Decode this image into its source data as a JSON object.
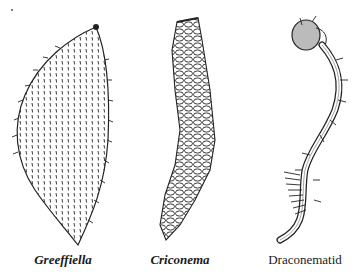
{
  "figure": {
    "specimens": [
      {
        "name": "Greeffiella",
        "style": "italic-bold"
      },
      {
        "name": "Criconema",
        "style": "italic-bold"
      },
      {
        "name": "Draconematid",
        "style": "roman"
      }
    ]
  },
  "colors": {
    "ink": "#1a1a1a",
    "paper": "#ffffff"
  }
}
